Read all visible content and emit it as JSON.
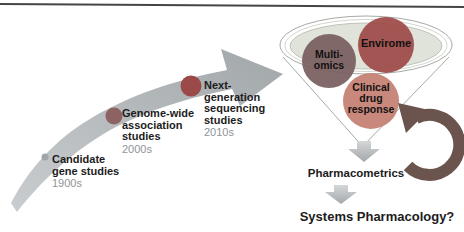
{
  "timeline": {
    "items": [
      {
        "lines": [
          "Candidate",
          "gene studies"
        ],
        "era": "1900s",
        "dot_color": "#9fa5a7"
      },
      {
        "lines": [
          "Genome-wide",
          "association",
          "studies"
        ],
        "era": "2000s",
        "dot_color": "#8c6262"
      },
      {
        "lines": [
          "Next-",
          "generation",
          "sequencing",
          "studies"
        ],
        "era": "2010s",
        "dot_color": "#9b4a49"
      }
    ]
  },
  "funnel": {
    "bubbles": [
      {
        "lines": [
          "Multi-",
          "omics"
        ],
        "color": "#7a5f5f"
      },
      {
        "lines": [
          "Envirome"
        ],
        "color": "#9d4a47"
      },
      {
        "lines": [
          "Clinical",
          "drug",
          "response"
        ],
        "color": "#c47f71"
      }
    ]
  },
  "flow": {
    "pharmacometrics_label": "Pharmacometrics",
    "systems_pharmacology_label": "Systems Pharmacology?"
  },
  "colors": {
    "background": "#ffffff",
    "top_rule": "#454545",
    "label_text": "#1c1c1c",
    "era_text": "#8f9497",
    "timeline_arrow_gray": "#b0b5b8",
    "funnel_outline": "#a6aaa4",
    "funnel_rim_fill": "#dfe3da",
    "feedback_arrow": "#6b544e",
    "down_arrow_gray": "#b9bdbf"
  }
}
